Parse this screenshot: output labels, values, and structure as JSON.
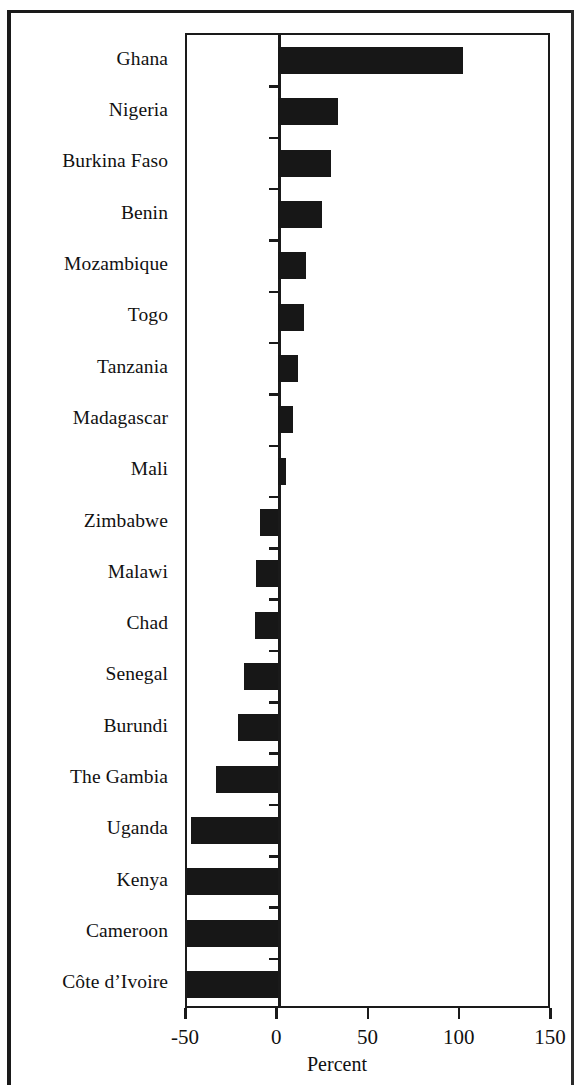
{
  "chart_data": {
    "type": "bar",
    "orientation": "horizontal",
    "title": "",
    "subtitle": "",
    "xlabel": "Percent",
    "ylabel": "",
    "xlim": [
      -50,
      150
    ],
    "xticks": [
      -50,
      0,
      50,
      100,
      150
    ],
    "xtick_labels": [
      "-50",
      "0",
      "50",
      "100",
      "150"
    ],
    "grid": false,
    "legend": null,
    "bar_color": "#171717",
    "axis_color": "#1a1a1a",
    "background_color": "#ffffff",
    "note": "Bars for Kenya, Cameroon and Cote d'Ivoire reach the left axis limit (-50) and appear clipped.",
    "categories": [
      "Ghana",
      "Nigeria",
      "Burkina Faso",
      "Benin",
      "Mozambique",
      "Togo",
      "Tanzania",
      "Madagascar",
      "Mali",
      "Zimbabwe",
      "Malawi",
      "Chad",
      "Senegal",
      "Burundi",
      "The Gambia",
      "Uganda",
      "Kenya",
      "Cameroon",
      "Côte d’Ivoire"
    ],
    "values": [
      101,
      33,
      29,
      24,
      15,
      14,
      11,
      8,
      4,
      -10,
      -12,
      -13,
      -19,
      -22,
      -34,
      -48,
      -50,
      -50,
      -50
    ]
  }
}
